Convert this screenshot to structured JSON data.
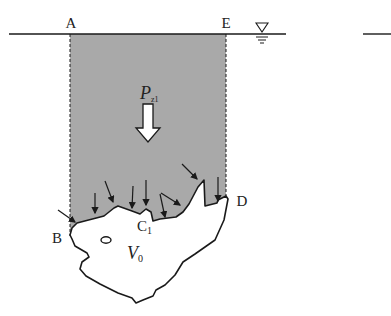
{
  "diagram": {
    "type": "hydrostatic pressure body diagram",
    "labels": {
      "point_a": "A",
      "point_e": "E",
      "point_b": "B",
      "point_d": "D",
      "point_c": "C",
      "point_c_sub": "1",
      "force": "P",
      "force_sub": "z1",
      "volume": "V",
      "volume_sub": "0"
    },
    "symbols": {
      "free_surface": "water-level-triangle-icon"
    },
    "colors": {
      "shading": "#a9a9a9",
      "line": "#1a1a1a",
      "background": "#ffffff"
    }
  }
}
